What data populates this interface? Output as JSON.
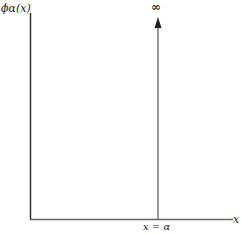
{
  "diagram": {
    "y_axis_label": "ϕα(x)",
    "x_axis_label": "x",
    "spike_label": "∞",
    "spike_position_label": "x = α",
    "colors": {
      "axis": "#333333",
      "spike": "#555555",
      "text": "#222222"
    }
  }
}
